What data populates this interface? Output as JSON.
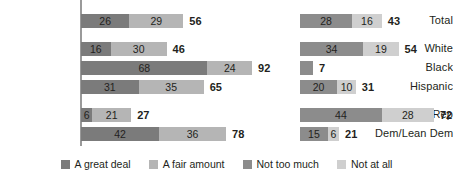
{
  "legend": {
    "items": [
      {
        "label": "A great deal",
        "color": "#7b7b7b"
      },
      {
        "label": "A fair amount",
        "color": "#b5b5b5"
      },
      {
        "label": "Not too much",
        "color": "#8c8c8c"
      },
      {
        "label": "Not at all",
        "color": "#cfcfcf"
      }
    ]
  },
  "axis": {
    "color": "#9a9a9a"
  },
  "chart_data": {
    "type": "bar",
    "title": "",
    "subtitle": "",
    "xlabel": "",
    "ylabel": "",
    "orientation": "horizontal",
    "stacked": true,
    "grid": false,
    "legend_position": "bottom",
    "px_per_unit": 1.86,
    "panels": [
      {
        "name": "left-panel",
        "series": [
          "A great deal",
          "A fair amount"
        ],
        "total_label": "NET"
      },
      {
        "name": "right-panel",
        "series": [
          "Not too much",
          "Not at all"
        ],
        "total_label": "NET"
      }
    ],
    "categories": [
      "Total",
      "White",
      "Black",
      "Hispanic",
      "Rep/Lean Rep",
      "Dem/Lean Dem"
    ],
    "rows": [
      {
        "category": "Total",
        "y": 14,
        "left": {
          "segments": [
            26,
            29
          ],
          "net": 56
        },
        "right": {
          "segments": [
            28,
            16
          ],
          "net": 43
        }
      },
      {
        "category": "White",
        "y": 42,
        "left": {
          "segments": [
            16,
            30
          ],
          "net": 46
        },
        "right": {
          "segments": [
            34,
            19
          ],
          "net": 54
        }
      },
      {
        "category": "Black",
        "y": 61,
        "left": {
          "segments": [
            68,
            24
          ],
          "net": 92
        },
        "right": {
          "segments": [
            7
          ],
          "net": 7,
          "hide_segment_labels": true
        }
      },
      {
        "category": "Hispanic",
        "y": 80,
        "left": {
          "segments": [
            31,
            35
          ],
          "net": 65
        },
        "right": {
          "segments": [
            20,
            10
          ],
          "net": 31
        }
      },
      {
        "category": "Rep/Lean Rep",
        "y": 108,
        "left": {
          "segments": [
            6,
            21
          ],
          "net": 27
        },
        "right": {
          "segments": [
            44,
            28
          ],
          "net": 72
        }
      },
      {
        "category": "Dem/Lean Dem",
        "y": 127,
        "left": {
          "segments": [
            42,
            36
          ],
          "net": 78
        },
        "right": {
          "segments": [
            15,
            6
          ],
          "net": 21
        }
      }
    ]
  }
}
